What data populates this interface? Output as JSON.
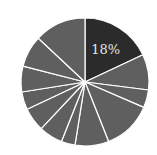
{
  "chart_data": {
    "type": "pie",
    "title": "",
    "start_angle_deg": 0,
    "direction": "clockwise",
    "center": [
      85,
      82
    ],
    "radius": 64,
    "slices": [
      {
        "value": 18,
        "label": "18%",
        "color": "#2b2b2b",
        "show_label": true
      },
      {
        "value": 9,
        "label": "",
        "color": "#5f5f5f",
        "show_label": false
      },
      {
        "value": 4.5,
        "label": "",
        "color": "#5f5f5f",
        "show_label": false
      },
      {
        "value": 12.5,
        "label": "",
        "color": "#5f5f5f",
        "show_label": false
      },
      {
        "value": 8.5,
        "label": "",
        "color": "#5f5f5f",
        "show_label": false
      },
      {
        "value": 3.5,
        "label": "",
        "color": "#5f5f5f",
        "show_label": false
      },
      {
        "value": 6,
        "label": "",
        "color": "#5f5f5f",
        "show_label": false
      },
      {
        "value": 6,
        "label": "",
        "color": "#5f5f5f",
        "show_label": false
      },
      {
        "value": 4.5,
        "label": "",
        "color": "#5f5f5f",
        "show_label": false
      },
      {
        "value": 6.5,
        "label": "",
        "color": "#5f5f5f",
        "show_label": false
      },
      {
        "value": 8,
        "label": "",
        "color": "#5f5f5f",
        "show_label": false
      },
      {
        "value": 13,
        "label": "",
        "color": "#5f5f5f",
        "show_label": false
      }
    ],
    "separator_color": "#ffffff",
    "legend": null
  }
}
